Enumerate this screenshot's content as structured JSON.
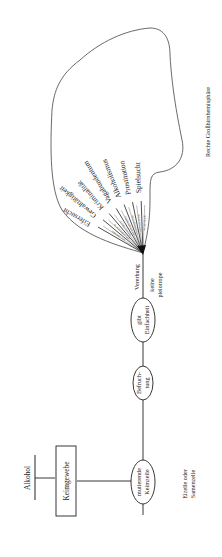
{
  "diagram": {
    "cause": "Alkohol",
    "tissue_box": "Keimgewebe",
    "nodes": [
      {
        "id": "mutierende",
        "lines": [
          "mutierende",
          "Keimzelle"
        ]
      },
      {
        "id": "befruchtung",
        "lines": [
          "Befruch-",
          "tung"
        ]
      },
      {
        "id": "einfachheit",
        "lines": [
          "gibt",
          "Einfachheit"
        ]
      }
    ],
    "cell_note": [
      "Eizelle oder",
      "Samenzelle"
    ],
    "inheritance_label": "Vererbung",
    "pleiotropy_label": [
      "keine",
      "pleiotrope"
    ],
    "region_label": "Rechte Großhirnhemisphäre",
    "traits": [
      "Eifersucht",
      "Gewalttätigkeit",
      "Kriminalität",
      "Vagabundentum",
      "Alkoholismus",
      "Prostitution",
      "Spielsucht"
    ],
    "gene_labels": [
      "Eifersucht Gen",
      "Gewalttätigkeit Gen",
      "Kriminalität Gen",
      "Vagabundentum Gen",
      "Alkoholismus Gen",
      "Prostitution Gen",
      "Spielsucht Gen"
    ]
  }
}
